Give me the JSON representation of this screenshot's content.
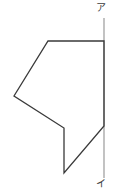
{
  "figure": {
    "canvas": {
      "width": 118,
      "height": 196,
      "background": "#ffffff"
    },
    "labels": {
      "top": "ア",
      "bottom": "イ"
    },
    "colors": {
      "polygon_stroke": "#3a3a3a",
      "polygon_fill": "none",
      "axis_stroke": "#9a9a9a",
      "label_text": "#3c3c3c"
    },
    "reference_line": {
      "name": "vertical-axis",
      "x": 104,
      "y_top": 18,
      "y_bottom": 178,
      "stroke_width": 1.2,
      "top_label": "ア",
      "bottom_label": "イ"
    },
    "polygon": {
      "name": "concave-pentagon",
      "closed": true,
      "stroke_width": 1.3,
      "points": "104,41 48,41 14,96 64,128 64,173 104,126",
      "vertices": [
        {
          "id": "v1",
          "x": 104,
          "y": 41,
          "note": "top-right on axis"
        },
        {
          "id": "v2",
          "x": 48,
          "y": 41,
          "note": "top-left"
        },
        {
          "id": "v3",
          "x": 14,
          "y": 96,
          "note": "left"
        },
        {
          "id": "v4",
          "x": 64,
          "y": 128,
          "note": "inner notch"
        },
        {
          "id": "v5",
          "x": 64,
          "y": 173,
          "note": "bottom"
        },
        {
          "id": "v6",
          "x": 104,
          "y": 126,
          "note": "right on axis"
        }
      ],
      "edges": [
        {
          "from": "v1",
          "to": "v2",
          "kind": "horizontal-top"
        },
        {
          "from": "v2",
          "to": "v3",
          "kind": "diagonal-upper-left"
        },
        {
          "from": "v3",
          "to": "v4",
          "kind": "diagonal-lower-left"
        },
        {
          "from": "v4",
          "to": "v5",
          "kind": "vertical-inner"
        },
        {
          "from": "v5",
          "to": "v6",
          "kind": "diagonal-lower-right"
        },
        {
          "from": "v6",
          "to": "v1",
          "kind": "segment-on-axis"
        }
      ]
    }
  }
}
